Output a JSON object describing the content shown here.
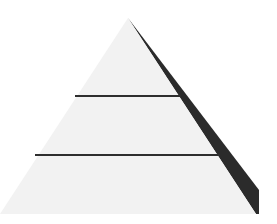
{
  "diagram": {
    "type": "pyramid",
    "levels": 3,
    "colors": {
      "background": "#ffffff",
      "face": "#f2f2f2",
      "shadow": "#2b2b2b",
      "divider": "#2e2e2e"
    }
  }
}
